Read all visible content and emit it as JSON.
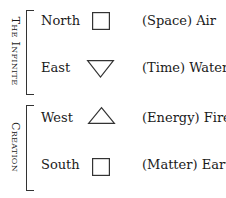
{
  "groups": [
    {
      "label": "The Infinite"
    },
    {
      "label": "Creation"
    }
  ],
  "rows": [
    {
      "direction": "North",
      "symbol": "square-icon",
      "element": "(Space) Air"
    },
    {
      "direction": "East",
      "symbol": "inverted-triangle-icon",
      "element": "(Time) Water"
    },
    {
      "direction": "West",
      "symbol": "triangle-icon",
      "element": "(Energy) Fire"
    },
    {
      "direction": "South",
      "symbol": "square-icon",
      "element": "(Matter) Earth"
    }
  ],
  "colors": {
    "stroke": "#333333",
    "text": "#1a1a1a"
  }
}
